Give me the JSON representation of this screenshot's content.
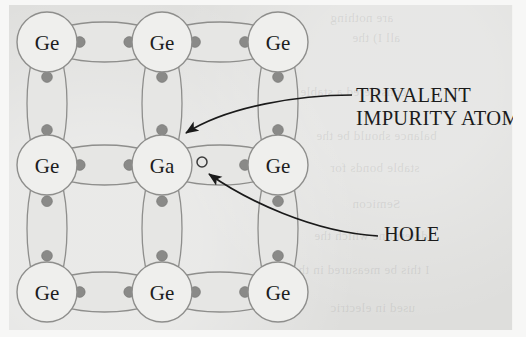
{
  "figure": {
    "type": "diagram",
    "background_color": "#dededc",
    "bond_fill": "#e6e6e4",
    "bond_stroke": "#8e8e8c",
    "atom_fill": "#efefed",
    "atom_stroke": "#8e8e8c",
    "electron_color": "#8a8a88",
    "hole_stroke": "#3a3a3a",
    "text_color": "#1b1b1b"
  },
  "lattice": {
    "rows": 3,
    "cols": 3,
    "atom_radius": 30,
    "columns_x": [
      47,
      162,
      278
    ],
    "rows_y": [
      42,
      165,
      292
    ],
    "atoms": [
      {
        "id": "a00",
        "label": "Ge",
        "col": 0,
        "row": 0,
        "x": 47,
        "y": 42,
        "kind": "host"
      },
      {
        "id": "a10",
        "label": "Ge",
        "col": 1,
        "row": 0,
        "x": 162,
        "y": 42,
        "kind": "host"
      },
      {
        "id": "a20",
        "label": "Ge",
        "col": 2,
        "row": 0,
        "x": 278,
        "y": 42,
        "kind": "host"
      },
      {
        "id": "a01",
        "label": "Ge",
        "col": 0,
        "row": 1,
        "x": 47,
        "y": 165,
        "kind": "host"
      },
      {
        "id": "a11",
        "label": "Ga",
        "col": 1,
        "row": 1,
        "x": 162,
        "y": 165,
        "kind": "impurity"
      },
      {
        "id": "a21",
        "label": "Ge",
        "col": 2,
        "row": 1,
        "x": 278,
        "y": 165,
        "kind": "host"
      },
      {
        "id": "a02",
        "label": "Ge",
        "col": 0,
        "row": 2,
        "x": 47,
        "y": 292,
        "kind": "host"
      },
      {
        "id": "a12",
        "label": "Ge",
        "col": 1,
        "row": 2,
        "x": 162,
        "y": 292,
        "kind": "host"
      },
      {
        "id": "a22",
        "label": "Ge",
        "col": 2,
        "row": 2,
        "x": 278,
        "y": 292,
        "kind": "host"
      }
    ],
    "bonds": [
      {
        "id": "b-h-r0c0",
        "orientation": "horizontal",
        "from": "a00",
        "to": "a10",
        "electrons": 2,
        "hole": false
      },
      {
        "id": "b-h-r0c1",
        "orientation": "horizontal",
        "from": "a10",
        "to": "a20",
        "electrons": 2,
        "hole": false
      },
      {
        "id": "b-h-r1c0",
        "orientation": "horizontal",
        "from": "a01",
        "to": "a11",
        "electrons": 2,
        "hole": false
      },
      {
        "id": "b-h-r1c1",
        "orientation": "horizontal",
        "from": "a11",
        "to": "a21",
        "electrons": 1,
        "hole": true
      },
      {
        "id": "b-h-r2c0",
        "orientation": "horizontal",
        "from": "a02",
        "to": "a12",
        "electrons": 2,
        "hole": false
      },
      {
        "id": "b-h-r2c1",
        "orientation": "horizontal",
        "from": "a12",
        "to": "a22",
        "electrons": 2,
        "hole": false
      },
      {
        "id": "b-v-c0r0",
        "orientation": "vertical",
        "from": "a00",
        "to": "a01",
        "electrons": 2,
        "hole": false
      },
      {
        "id": "b-v-c1r0",
        "orientation": "vertical",
        "from": "a10",
        "to": "a11",
        "electrons": 2,
        "hole": false
      },
      {
        "id": "b-v-c2r0",
        "orientation": "vertical",
        "from": "a20",
        "to": "a21",
        "electrons": 2,
        "hole": false
      },
      {
        "id": "b-v-c0r1",
        "orientation": "vertical",
        "from": "a01",
        "to": "a02",
        "electrons": 2,
        "hole": false
      },
      {
        "id": "b-v-c1r1",
        "orientation": "vertical",
        "from": "a11",
        "to": "a12",
        "electrons": 2,
        "hole": false
      },
      {
        "id": "b-v-c2r1",
        "orientation": "vertical",
        "from": "a21",
        "to": "a22",
        "electrons": 2,
        "hole": false
      }
    ],
    "hole": {
      "x": 202,
      "y": 162,
      "radius": 5,
      "filled": false
    }
  },
  "callouts": [
    {
      "id": "trivalent",
      "line1": "TRIVALENT",
      "line2": "IMPURITY ATOM",
      "points_to": "a11",
      "arrow_tip": {
        "x": 184,
        "y": 134
      },
      "arrow_tail": {
        "x": 352,
        "y": 95
      }
    },
    {
      "id": "hole",
      "line1": "HOLE",
      "line2": "",
      "points_to": "hole",
      "arrow_tip": {
        "x": 207,
        "y": 173
      },
      "arrow_tail": {
        "x": 378,
        "y": 236
      }
    }
  ],
  "ghost_text": [
    {
      "text": "are nothing",
      "x": 330,
      "y": 10
    },
    {
      "text": "all I) the",
      "x": 352,
      "y": 30
    },
    {
      "text": "considered a stable",
      "x": 300,
      "y": 84
    },
    {
      "text": "balance should be the",
      "x": 316,
      "y": 128
    },
    {
      "text": "stable bonds for",
      "x": 330,
      "y": 160
    },
    {
      "text": "Semicon",
      "x": 352,
      "y": 196
    },
    {
      "text": "determine which the",
      "x": 314,
      "y": 228
    },
    {
      "text": "I this be measured in the",
      "x": 292,
      "y": 262
    },
    {
      "text": "used in electric",
      "x": 330,
      "y": 300
    }
  ]
}
